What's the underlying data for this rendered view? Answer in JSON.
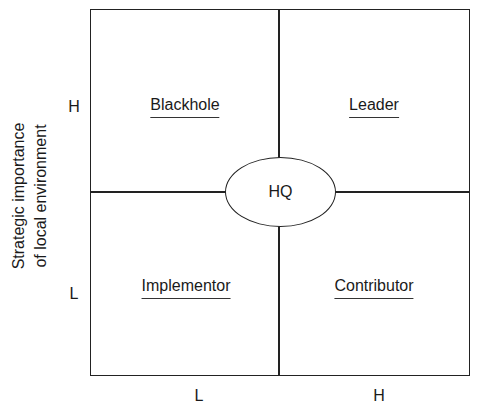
{
  "diagram": {
    "type": "2x2 matrix",
    "y_axis": {
      "label_line1": "Strategic importance",
      "label_line2": "of local environment",
      "ticks": {
        "high": "H",
        "low": "L"
      }
    },
    "x_axis": {
      "ticks": {
        "low": "L",
        "high": "H"
      }
    },
    "quadrants": {
      "top_left": "Blackhole",
      "top_right": "Leader",
      "bottom_left": "Implementor",
      "bottom_right": "Contributor"
    },
    "center": "HQ"
  }
}
